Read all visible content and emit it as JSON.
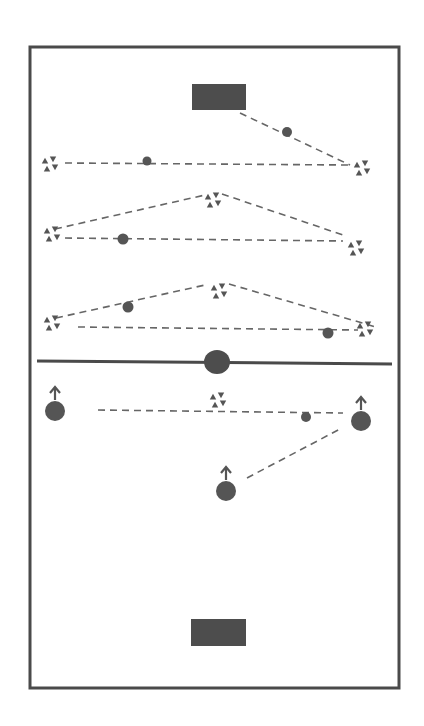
{
  "diagram": {
    "type": "soccer-drill",
    "colors": {
      "background": "#ffffff",
      "field_border": "#4a4a4a",
      "goal": "#4d4d4d",
      "ink": "#555555",
      "dash": "#666666"
    },
    "field": {
      "x": 30,
      "y": 47,
      "width": 369,
      "height": 641
    },
    "halfway_line": {
      "x1": 37,
      "y1": 361,
      "x2": 392,
      "y2": 364
    },
    "center_spot": {
      "cx": 217,
      "cy": 362,
      "r": 13
    },
    "goals": [
      {
        "id": "top-goal",
        "x": 192,
        "y": 84,
        "width": 54,
        "height": 26
      },
      {
        "id": "bottom-goal",
        "x": 191,
        "y": 619,
        "width": 55,
        "height": 27
      }
    ],
    "cones": [
      {
        "id": "cone-a",
        "cx": 50,
        "cy": 164
      },
      {
        "id": "cone-b",
        "cx": 362,
        "cy": 168
      },
      {
        "id": "cone-c",
        "cx": 213,
        "cy": 200
      },
      {
        "id": "cone-d",
        "cx": 52,
        "cy": 234
      },
      {
        "id": "cone-e",
        "cx": 356,
        "cy": 248
      },
      {
        "id": "cone-f",
        "cx": 219,
        "cy": 291
      },
      {
        "id": "cone-g",
        "cx": 52,
        "cy": 323
      },
      {
        "id": "cone-h",
        "cx": 365,
        "cy": 329
      },
      {
        "id": "cone-i",
        "cx": 218,
        "cy": 400
      }
    ],
    "balls": [
      {
        "id": "ball-1",
        "cx": 287,
        "cy": 132,
        "r": 5
      },
      {
        "id": "ball-2",
        "cx": 147,
        "cy": 161,
        "r": 4.5
      },
      {
        "id": "ball-3",
        "cx": 123,
        "cy": 239,
        "r": 5.5
      },
      {
        "id": "ball-4",
        "cx": 128,
        "cy": 307,
        "r": 5.5
      },
      {
        "id": "ball-5",
        "cx": 328,
        "cy": 333,
        "r": 5.5
      },
      {
        "id": "ball-6",
        "cx": 306,
        "cy": 417,
        "r": 5
      }
    ],
    "players": [
      {
        "id": "player-left",
        "cx": 55,
        "cy": 411,
        "r": 10
      },
      {
        "id": "player-right",
        "cx": 361,
        "cy": 421,
        "r": 10
      },
      {
        "id": "player-bottom",
        "cx": 226,
        "cy": 491,
        "r": 10
      }
    ],
    "passes": [
      {
        "id": "pass-1",
        "x1": 240,
        "y1": 113,
        "x2": 350,
        "y2": 165
      },
      {
        "id": "pass-2",
        "x1": 65,
        "y1": 163,
        "x2": 348,
        "y2": 165
      },
      {
        "id": "pass-3",
        "x1": 55,
        "y1": 229,
        "x2": 205,
        "y2": 195
      },
      {
        "id": "pass-4",
        "x1": 222,
        "y1": 194,
        "x2": 346,
        "y2": 236
      },
      {
        "id": "pass-5",
        "x1": 65,
        "y1": 238,
        "x2": 343,
        "y2": 241
      },
      {
        "id": "pass-6",
        "x1": 56,
        "y1": 318,
        "x2": 205,
        "y2": 285
      },
      {
        "id": "pass-7",
        "x1": 229,
        "y1": 284,
        "x2": 376,
        "y2": 327
      },
      {
        "id": "pass-8",
        "x1": 78,
        "y1": 327,
        "x2": 358,
        "y2": 330
      },
      {
        "id": "pass-9",
        "x1": 98,
        "y1": 410,
        "x2": 343,
        "y2": 413
      },
      {
        "id": "pass-10",
        "x1": 247,
        "y1": 478,
        "x2": 340,
        "y2": 429
      }
    ]
  }
}
